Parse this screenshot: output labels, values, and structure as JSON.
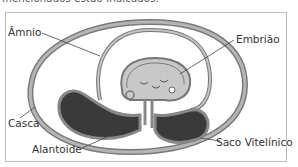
{
  "header": {
    "truncated_text": "mencionados estão indicados."
  },
  "diagram": {
    "labels": {
      "amnio": "Âmnio",
      "embriao": "Embrião",
      "casca": "Casca",
      "alantoide": "Alantoide",
      "saco_vitelinico": "Saco Vitelínico"
    },
    "colors": {
      "shell_fill": "#9a9a9a",
      "membrane": "#7a7a7a",
      "yolk": "#3a3a3a",
      "embryo_fill": "#c8c8c8",
      "background": "#ffffff"
    }
  }
}
